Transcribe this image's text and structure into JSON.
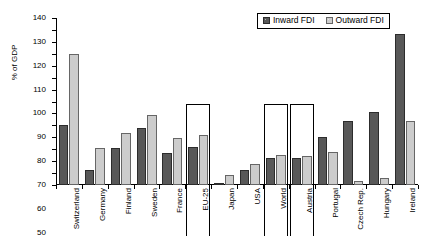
{
  "chart_data": {
    "type": "bar",
    "title": "",
    "xlabel": "",
    "ylabel": "% of GDP",
    "ylim": [
      0,
      140
    ],
    "ytick_step": 10,
    "grid": false,
    "legend_position": "top-right",
    "categories": [
      "Switzerland",
      "Germany",
      "Finland",
      "Sweden",
      "France",
      "EU-25",
      "Japan",
      "USA",
      "World",
      "Austria",
      "Portugal",
      "Czech Rep.",
      "Hungary",
      "Ireland"
    ],
    "ytick_labels": [
      "0",
      "10",
      "20",
      "30",
      "40",
      "50",
      "60",
      "70",
      "80",
      "90",
      "100",
      "110",
      "120",
      "130",
      "140"
    ],
    "series": [
      {
        "name": "Inward FDI",
        "color": "#585858",
        "values": [
          50,
          13,
          31,
          48,
          27,
          32,
          2,
          13,
          23,
          23,
          40,
          54,
          61,
          127
        ]
      },
      {
        "name": "Outward FDI",
        "color": "#cccccc",
        "values": [
          110,
          31,
          44,
          59,
          39,
          42,
          8,
          18,
          25,
          24,
          28,
          3,
          6,
          54
        ]
      }
    ],
    "highlighted_categories": [
      "EU-25",
      "World",
      "Austria"
    ]
  },
  "legend": {
    "items": [
      {
        "label": "Inward FDI",
        "swatch": "inward"
      },
      {
        "label": "Outward FDI",
        "swatch": "outward"
      }
    ]
  }
}
